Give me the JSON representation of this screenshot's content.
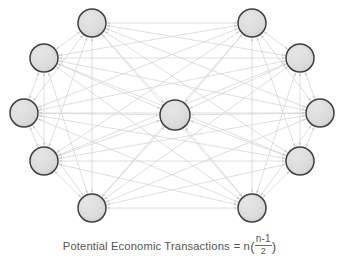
{
  "figure": {
    "caption": {
      "lead": "Potential  Economic  Transactions",
      "equals": "=",
      "multiplier": "n",
      "open_paren": "(",
      "numerator": "n-1",
      "close_paren": ")",
      "denominator": "2",
      "plain_text": "Potential Economic Transactions = n(n-1)/2"
    },
    "colors": {
      "background": "#ffffff",
      "node_fill": "#d9d9d9",
      "node_stroke": "#3f3f3f",
      "edge": "#d6d6d6",
      "arrow": "#cfcfcf",
      "caption_text": "#555555"
    }
  },
  "graph_data": {
    "type": "network",
    "node_count": 11,
    "edge_style": "double-arrow",
    "fully_connected": true,
    "node_radius": 14,
    "center_node_radius": 15,
    "nodes": [
      {
        "id": "n1",
        "label": "",
        "x": 92,
        "y": 23,
        "r": 14,
        "position": "top-left"
      },
      {
        "id": "n2",
        "label": "",
        "x": 252,
        "y": 23,
        "r": 14,
        "position": "top-right"
      },
      {
        "id": "n3",
        "label": "",
        "x": 44,
        "y": 58,
        "r": 14,
        "position": "upper-left"
      },
      {
        "id": "n4",
        "label": "",
        "x": 300,
        "y": 58,
        "r": 14,
        "position": "upper-right"
      },
      {
        "id": "n5",
        "label": "",
        "x": 24,
        "y": 113,
        "r": 14,
        "position": "mid-left"
      },
      {
        "id": "n6",
        "label": "",
        "x": 320,
        "y": 113,
        "r": 14,
        "position": "mid-right"
      },
      {
        "id": "n7",
        "label": "",
        "x": 44,
        "y": 161,
        "r": 14,
        "position": "lower-left"
      },
      {
        "id": "n8",
        "label": "",
        "x": 300,
        "y": 161,
        "r": 14,
        "position": "lower-right"
      },
      {
        "id": "n9",
        "label": "",
        "x": 92,
        "y": 208,
        "r": 14,
        "position": "bottom-left"
      },
      {
        "id": "n10",
        "label": "",
        "x": 252,
        "y": 208,
        "r": 14,
        "position": "bottom-right"
      },
      {
        "id": "n11",
        "label": "",
        "x": 175,
        "y": 115,
        "r": 15,
        "position": "center"
      }
    ]
  }
}
